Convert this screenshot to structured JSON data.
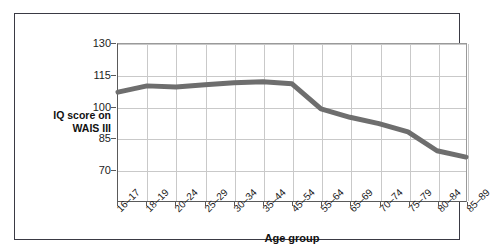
{
  "chart_data": {
    "type": "line",
    "title": "",
    "subtitle": "",
    "xlabel": "Age group",
    "ylabel": "IQ score on WAIS III",
    "categories": [
      "16–17",
      "18–19",
      "20–24",
      "25–29",
      "30–34",
      "35–44",
      "45–54",
      "55–64",
      "65–69",
      "70–74",
      "75–79",
      "80–84",
      "85–89"
    ],
    "series": [
      {
        "name": "IQ score on WAIS III",
        "color": "#6e6e6e",
        "values": [
          107,
          110,
          109.5,
          110.5,
          111.5,
          112,
          111,
          99,
          95,
          92,
          88,
          79,
          76
        ]
      }
    ],
    "ylim": [
      55,
      130
    ],
    "yticks": [
      130,
      115,
      100,
      85,
      70
    ],
    "ytick_labels": [
      "130",
      "115",
      "100",
      "85",
      "70"
    ],
    "grid": true,
    "grid_color": "#c9c9c9",
    "legend": false,
    "legend_position": "none",
    "line_width": 5,
    "axis_color": "#5a5a5a",
    "frame_color": "#3a3a44",
    "background": "#ffffff"
  },
  "axes": {
    "y_title_line1": "IQ score on",
    "y_title_line2": "WAIS III",
    "x_title": "Age group"
  }
}
